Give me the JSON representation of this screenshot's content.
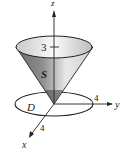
{
  "diagram": {
    "type": "3d-surface-figure",
    "axes": {
      "z_label": "z",
      "y_label": "y",
      "x_label": "x"
    },
    "labels": {
      "surface": "S",
      "region": "D",
      "height_tick": "3",
      "y_radius": "4",
      "x_radius": "4"
    },
    "colors": {
      "stroke": "#222222",
      "cone_light": "#f4f4f4",
      "cone_dark": "#555555",
      "background": "#ffffff"
    }
  }
}
